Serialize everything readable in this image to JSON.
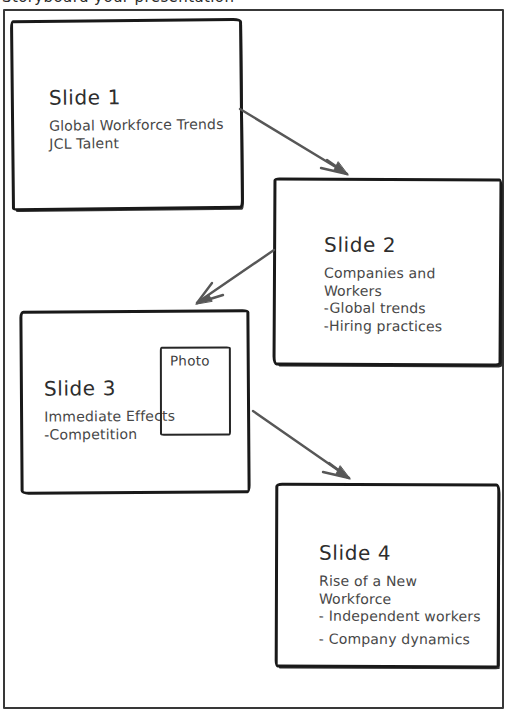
{
  "page": {
    "top_caption": "Storyboard your presentation"
  },
  "palette": {
    "background": "#ffffff",
    "frame_color": "#383838",
    "ink_color": "#191919",
    "arrow_color": "#575757",
    "title_color": "#2d2d2d",
    "body_color": "#474747"
  },
  "slides": [
    {
      "id": "slide-1",
      "title": "Slide 1",
      "lines": [
        "Global Workforce Trends",
        "JCL Talent"
      ]
    },
    {
      "id": "slide-2",
      "title": "Slide 2",
      "lines": [
        "Companies and Workers",
        "-Global trends",
        "-Hiring practices"
      ]
    },
    {
      "id": "slide-3",
      "title": "Slide 3",
      "lines": [
        "Immediate Effects",
        "-Competition"
      ],
      "photo_label": "Photo"
    },
    {
      "id": "slide-4",
      "title": "Slide 4",
      "lines": [
        "Rise of a New Workforce",
        "- Independent workers",
        "- Company dynamics"
      ]
    }
  ],
  "connections": [
    {
      "from": "slide-1",
      "to": "slide-2"
    },
    {
      "from": "slide-2",
      "to": "slide-3"
    },
    {
      "from": "slide-3",
      "to": "slide-4"
    }
  ]
}
